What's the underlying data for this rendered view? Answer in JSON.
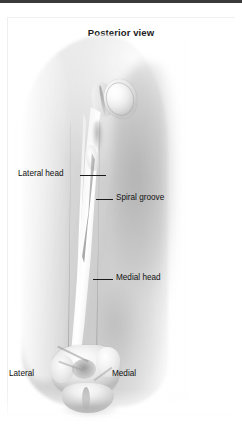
{
  "figure": {
    "title": "Posterior view",
    "colors": {
      "top_strip": "#3a3a3a",
      "page_background": "#ffffff",
      "soft_tissue": "#d7d7d7",
      "bone_highlight": "#ffffff",
      "bone_shadow": "#bcbcbc",
      "label_text": "#111111",
      "leader_line": "#1a1a1a"
    }
  },
  "labels": {
    "lateral_head": "Lateral head",
    "spiral_groove": "Spiral groove",
    "medial_head": "Medial head",
    "lateral": "Lateral",
    "medial": "Medial"
  },
  "structures": [
    {
      "name": "humeral-head",
      "label": ""
    },
    {
      "name": "greater-tubercle",
      "label": ""
    },
    {
      "name": "humeral-shaft",
      "label": ""
    },
    {
      "name": "spiral-groove",
      "label": "Spiral groove"
    },
    {
      "name": "medial-epicondyle",
      "label": ""
    },
    {
      "name": "lateral-epicondyle",
      "label": ""
    },
    {
      "name": "olecranon-fossa",
      "label": ""
    },
    {
      "name": "trochlea",
      "label": ""
    }
  ]
}
